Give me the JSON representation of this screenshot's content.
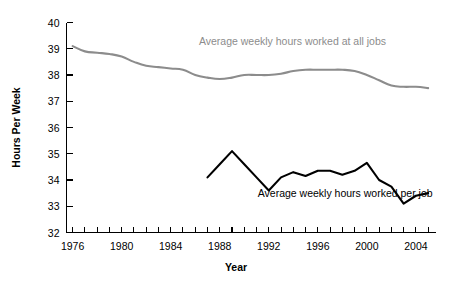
{
  "chart_data": {
    "type": "line",
    "title": "",
    "subtitle": "",
    "xlabel": "Year",
    "ylabel": "Hours Per Week",
    "xlim": [
      1975.5,
      2005.6
    ],
    "ylim": [
      32,
      40
    ],
    "grid": false,
    "legend_position": "inline-annotation",
    "y_ticks": [
      32,
      33,
      34,
      35,
      36,
      37,
      38,
      39,
      40
    ],
    "y_tick_labels": [
      "32",
      "33",
      "34",
      "35",
      "36",
      "37",
      "38",
      "39",
      "40"
    ],
    "x_ticks": [
      1976,
      1977,
      1978,
      1979,
      1980,
      1981,
      1982,
      1983,
      1984,
      1985,
      1986,
      1987,
      1988,
      1989,
      1990,
      1991,
      1992,
      1993,
      1994,
      1995,
      1996,
      1997,
      1998,
      1999,
      2000,
      2001,
      2002,
      2003,
      2004,
      2005
    ],
    "x_tick_labels": [
      "1976",
      "1980",
      "1984",
      "1988",
      "1992",
      "1996",
      "2000",
      "2004"
    ],
    "x_labeled_ticks": [
      1976,
      1980,
      1984,
      1988,
      1992,
      1996,
      2000,
      2004
    ],
    "series": [
      {
        "name": "Average weekly hours worked at all jobs",
        "color": "#8c8c8c",
        "label_x": 1986.3,
        "label_y": 39.15,
        "x": [
          1976,
          1977,
          1978,
          1979,
          1980,
          1981,
          1982,
          1983,
          1984,
          1985,
          1986,
          1987,
          1988,
          1989,
          1990,
          1991,
          1992,
          1993,
          1994,
          1995,
          1996,
          1997,
          1998,
          1999,
          2000,
          2001,
          2002,
          2003,
          2004,
          2005
        ],
        "values": [
          39.1,
          38.9,
          38.85,
          38.8,
          38.7,
          38.5,
          38.35,
          38.3,
          38.25,
          38.2,
          38.0,
          37.9,
          37.85,
          37.9,
          38.0,
          38.0,
          38.0,
          38.05,
          38.15,
          38.2,
          38.2,
          38.2,
          38.2,
          38.15,
          38.0,
          37.8,
          37.6,
          37.55,
          37.55,
          37.5
        ]
      },
      {
        "name": "Average weekly hours worked per job",
        "color": "#000000",
        "label_x": 1991.1,
        "label_y": 33.35,
        "x": [
          1987,
          1988,
          1989,
          1990,
          1991,
          1992,
          1993,
          1994,
          1995,
          1996,
          1997,
          1998,
          1999,
          2000,
          2001,
          2002,
          2003,
          2004,
          2005
        ],
        "values": [
          34.1,
          34.6,
          35.1,
          34.6,
          34.1,
          33.6,
          34.1,
          34.3,
          34.15,
          34.35,
          34.35,
          34.2,
          34.35,
          34.65,
          34.0,
          33.75,
          33.1,
          33.4,
          33.5
        ]
      }
    ]
  },
  "footer": {
    "note": ""
  }
}
